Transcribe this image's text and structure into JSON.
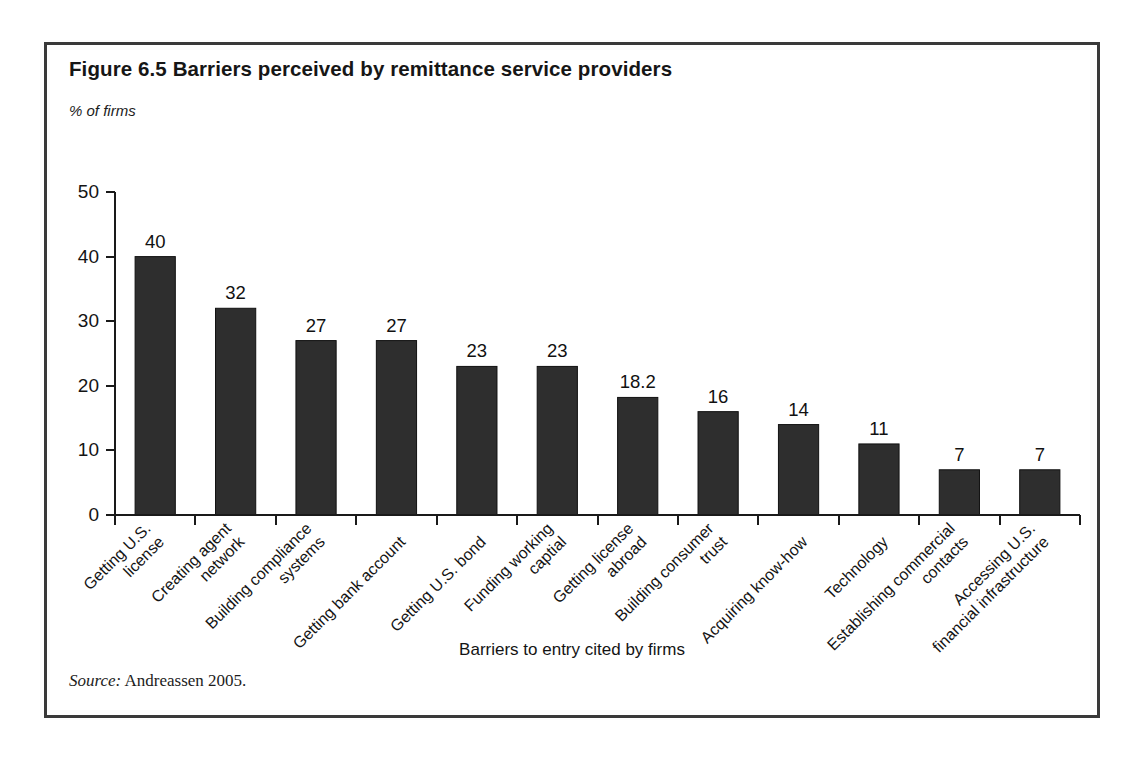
{
  "figure": {
    "title": "Figure 6.5  Barriers perceived by remittance service providers",
    "source_keyword": "Source:",
    "source_text": " Andreassen 2005."
  },
  "chart_data": {
    "type": "bar",
    "title": "Figure 6.5  Barriers perceived by remittance service providers",
    "ylabel": "% of firms",
    "xlabel": "Barriers to entry cited by firms",
    "ylim": [
      0,
      50
    ],
    "yticks": [
      0,
      10,
      20,
      30,
      40,
      50
    ],
    "ytick_labels": [
      "0",
      "10",
      "20",
      "30",
      "40",
      "50"
    ],
    "grid": false,
    "legend": false,
    "bar_color": "#2e2e2e",
    "categories": [
      "Getting U.S. license",
      "Creating agent network",
      "Building compliance systems",
      "Getting bank account",
      "Getting U.S. bond",
      "Funding working captial",
      "Getting license abroad",
      "Building consumer trust",
      "Acquiring know-how",
      "Technology",
      "Establishing commercial contacts",
      "Accessing U.S. financial infrastructure"
    ],
    "category_lines": [
      [
        "Getting U.S.",
        "license"
      ],
      [
        "Creating agent",
        "network"
      ],
      [
        "Building compliance",
        "systems"
      ],
      [
        "Getting bank account"
      ],
      [
        "Getting U.S. bond"
      ],
      [
        "Funding working",
        "captial"
      ],
      [
        "Getting license",
        "abroad"
      ],
      [
        "Building consumer",
        "trust"
      ],
      [
        "Acquiring know-how"
      ],
      [
        "Technology"
      ],
      [
        "Establishing commercial",
        "contacts"
      ],
      [
        "Accessing U.S.",
        "financial infrastructure"
      ]
    ],
    "values": [
      40,
      32,
      27,
      27,
      23,
      23,
      18.2,
      16,
      14,
      11,
      7,
      7
    ],
    "value_labels": [
      "40",
      "32",
      "27",
      "27",
      "23",
      "23",
      "18.2",
      "16",
      "14",
      "11",
      "7",
      "7"
    ]
  }
}
